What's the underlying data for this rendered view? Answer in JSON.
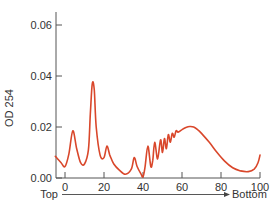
{
  "chart_data": {
    "type": "line",
    "title": "",
    "xlabel": "",
    "ylabel": "OD 254",
    "x_direction_labels": {
      "start": "Top",
      "end": "Bottom"
    },
    "xlim": [
      -5,
      100
    ],
    "ylim": [
      0,
      0.065
    ],
    "xticks": [
      0,
      20,
      40,
      60,
      80,
      100
    ],
    "yticks": [
      0.0,
      0.02,
      0.04,
      0.06
    ],
    "xtick_labels": [
      "0",
      "20",
      "40",
      "60",
      "80",
      "100"
    ],
    "ytick_labels": [
      "0.00",
      "0.02",
      "0.04",
      "0.06"
    ],
    "grid": false,
    "legend": null,
    "series": [
      {
        "name": "OD 254 profile",
        "color": "#d9472b",
        "x": [
          -5,
          -2,
          0,
          2,
          4,
          6,
          8,
          10,
          12,
          13,
          14,
          15,
          16,
          18,
          20,
          21.5,
          23,
          25,
          28,
          31,
          34,
          35.5,
          37,
          39,
          40,
          41,
          42.5,
          44,
          45,
          46,
          47.5,
          49,
          50,
          51,
          52,
          53,
          54,
          55,
          56,
          57,
          58,
          60,
          62,
          64,
          66,
          68,
          70,
          74,
          78,
          82,
          86,
          90,
          94,
          97,
          99,
          100
        ],
        "y": [
          0.0085,
          0.006,
          0.0045,
          0.0095,
          0.0185,
          0.0115,
          0.006,
          0.0055,
          0.011,
          0.025,
          0.037,
          0.0345,
          0.02,
          0.009,
          0.008,
          0.0125,
          0.009,
          0.0055,
          0.003,
          0.0015,
          0.0035,
          0.008,
          0.0045,
          0.0015,
          0.0005,
          0.004,
          0.0125,
          0.0045,
          0.007,
          0.014,
          0.0075,
          0.015,
          0.01,
          0.0155,
          0.0115,
          0.017,
          0.014,
          0.0175,
          0.016,
          0.0185,
          0.018,
          0.019,
          0.0198,
          0.0202,
          0.02,
          0.019,
          0.0175,
          0.014,
          0.01,
          0.0065,
          0.004,
          0.0028,
          0.0025,
          0.0035,
          0.006,
          0.009
        ]
      }
    ]
  },
  "labels": {
    "y_axis_title": "OD 254",
    "direction_start": "Top",
    "direction_end": "Bottom"
  }
}
